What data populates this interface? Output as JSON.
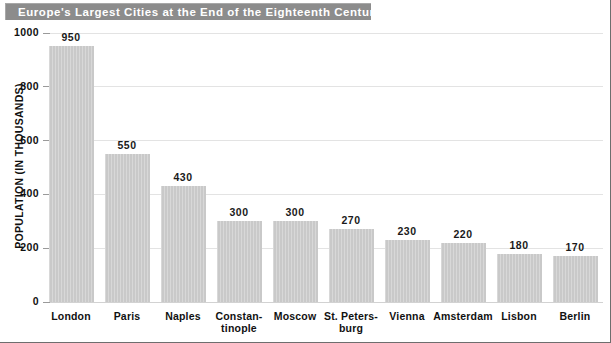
{
  "header": {
    "title": "Europe's Largest Cities at the End of the Eighteenth Century"
  },
  "chart_data": {
    "type": "bar",
    "title": "Europe's Largest Cities at the End of the Eighteenth Century",
    "xlabel": "",
    "ylabel": "POPULATION (IN THOUSANDS)",
    "ylim": [
      0,
      1000
    ],
    "yticks": [
      "0",
      "200",
      "400",
      "600",
      "800",
      "1000"
    ],
    "ytick_values": [
      0,
      200,
      400,
      600,
      800,
      1000
    ],
    "grid": true,
    "legend": null,
    "categories": [
      "London",
      "Paris",
      "Naples",
      "Constan-\ntinople",
      "Moscow",
      "St. Peters-\nburg",
      "Vienna",
      "Amsterdam",
      "Lisbon",
      "Berlin"
    ],
    "values": [
      950,
      550,
      430,
      300,
      300,
      270,
      230,
      220,
      180,
      170
    ],
    "value_labels": [
      "950",
      "550",
      "430",
      "300",
      "300",
      "270",
      "230",
      "220",
      "180",
      "170"
    ],
    "bars": [
      {
        "category_line1": "London",
        "category_line2": "",
        "value": 950,
        "label": "950"
      },
      {
        "category_line1": "Paris",
        "category_line2": "",
        "value": 550,
        "label": "550"
      },
      {
        "category_line1": "Naples",
        "category_line2": "",
        "value": 430,
        "label": "430"
      },
      {
        "category_line1": "Constan-",
        "category_line2": "tinople",
        "value": 300,
        "label": "300"
      },
      {
        "category_line1": "Moscow",
        "category_line2": "",
        "value": 300,
        "label": "300"
      },
      {
        "category_line1": "St. Peters-",
        "category_line2": "burg",
        "value": 270,
        "label": "270"
      },
      {
        "category_line1": "Vienna",
        "category_line2": "",
        "value": 230,
        "label": "230"
      },
      {
        "category_line1": "Amsterdam",
        "category_line2": "",
        "value": 220,
        "label": "220"
      },
      {
        "category_line1": "Lisbon",
        "category_line2": "",
        "value": 180,
        "label": "180"
      },
      {
        "category_line1": "Berlin",
        "category_line2": "",
        "value": 170,
        "label": "170"
      }
    ]
  },
  "colors": {
    "title_banner": "#8c8c8c",
    "title_text": "#ffffff",
    "bar_fill": "#c9c9c9",
    "gridline": "#e3e3e3",
    "text": "#111111",
    "background": "#ffffff"
  }
}
